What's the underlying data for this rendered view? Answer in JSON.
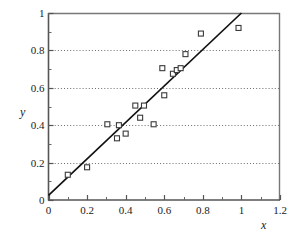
{
  "chart_data": {
    "type": "scatter",
    "title": "",
    "xlabel": "x",
    "ylabel": "y",
    "xlim": [
      0,
      1.2
    ],
    "ylim": [
      0,
      1
    ],
    "grid": "horizontal-dotted",
    "legend": "none",
    "x_ticks": [
      {
        "value": 0,
        "label": "0"
      },
      {
        "value": 0.2,
        "label": "0.2"
      },
      {
        "value": 0.4,
        "label": "0.4"
      },
      {
        "value": 0.6,
        "label": "0.6"
      },
      {
        "value": 0.8,
        "label": "0.8"
      },
      {
        "value": 1,
        "label": "1"
      },
      {
        "value": 1.2,
        "label": "1.2"
      }
    ],
    "y_ticks": [
      {
        "value": 0,
        "label": "0"
      },
      {
        "value": 0.2,
        "label": "0.2"
      },
      {
        "value": 0.4,
        "label": "0.4"
      },
      {
        "value": 0.6,
        "label": "0.6"
      },
      {
        "value": 0.8,
        "label": "0.8"
      },
      {
        "value": 1,
        "label": "1"
      }
    ],
    "x_minor_ticks": [
      0.1,
      0.3,
      0.5,
      0.7,
      0.9,
      1.1
    ],
    "y_minor_ticks": [
      0.1,
      0.3,
      0.5,
      0.7,
      0.9
    ],
    "gridline_values": [
      0.2,
      0.4,
      0.6,
      0.8
    ],
    "points": [
      {
        "x": 0.1,
        "y": 0.135
      },
      {
        "x": 0.2,
        "y": 0.175
      },
      {
        "x": 0.305,
        "y": 0.405
      },
      {
        "x": 0.355,
        "y": 0.33
      },
      {
        "x": 0.365,
        "y": 0.4
      },
      {
        "x": 0.4,
        "y": 0.355
      },
      {
        "x": 0.45,
        "y": 0.505
      },
      {
        "x": 0.475,
        "y": 0.44
      },
      {
        "x": 0.495,
        "y": 0.505
      },
      {
        "x": 0.545,
        "y": 0.405
      },
      {
        "x": 0.59,
        "y": 0.705
      },
      {
        "x": 0.6,
        "y": 0.56
      },
      {
        "x": 0.645,
        "y": 0.675
      },
      {
        "x": 0.665,
        "y": 0.695
      },
      {
        "x": 0.685,
        "y": 0.705
      },
      {
        "x": 0.71,
        "y": 0.78
      },
      {
        "x": 0.79,
        "y": 0.89
      },
      {
        "x": 0.985,
        "y": 0.92
      }
    ],
    "fit_line": {
      "x_start": 0.0,
      "y_start": 0.025,
      "x_end": 1.0,
      "y_end": 1.0
    },
    "marker": {
      "shape": "square-open",
      "size_px": 5,
      "edge_color": "#3a3a3a",
      "face_color": "#ffffff"
    },
    "line_color": "#111111",
    "axis_color": "#555555",
    "grid_color": "#6e6e6e"
  }
}
